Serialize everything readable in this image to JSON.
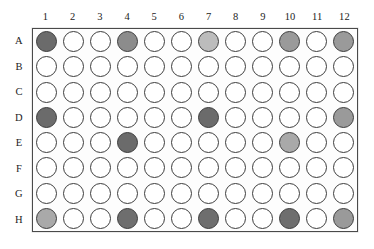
{
  "figure": {
    "plate_format": "96-well",
    "rows": 8,
    "columns": 12
  },
  "column_labels": [
    "1",
    "2",
    "3",
    "4",
    "5",
    "6",
    "7",
    "8",
    "9",
    "10",
    "11",
    "12"
  ],
  "row_labels": [
    "A",
    "B",
    "C",
    "D",
    "E",
    "F",
    "G",
    "H"
  ],
  "colors": {
    "empty_well_fill": "#ffffff",
    "well_outline": "#3d3d3d",
    "plate_border": "#4a4a4a",
    "plate_fill": "#fdfdfd",
    "background": "#ffffff",
    "label_text": "#1c1c1c",
    "shade_dark": "#6b6b6b",
    "shade_medium": "#8c8c8c",
    "shade_light": "#a9a9a9",
    "shade_pale": "#bcbcbc"
  },
  "chart_data": {
    "type": "heatmap",
    "xlabel": "",
    "ylabel": "",
    "grid": true,
    "legend_position": "none",
    "categories": [
      "1",
      "2",
      "3",
      "4",
      "5",
      "6",
      "7",
      "8",
      "9",
      "10",
      "11",
      "12"
    ],
    "row_categories": [
      "A",
      "B",
      "C",
      "D",
      "E",
      "F",
      "G",
      "H"
    ],
    "note": "values are well fill shades; 0 = empty (white), higher = darker fill",
    "filled_wells": [
      {
        "well": "A1",
        "row": "A",
        "column": 1,
        "shade": "#6b6b6b"
      },
      {
        "well": "A4",
        "row": "A",
        "column": 4,
        "shade": "#8c8c8c"
      },
      {
        "well": "A7",
        "row": "A",
        "column": 7,
        "shade": "#bcbcbc"
      },
      {
        "well": "A10",
        "row": "A",
        "column": 10,
        "shade": "#9a9a9a"
      },
      {
        "well": "A12",
        "row": "A",
        "column": 12,
        "shade": "#9a9a9a"
      },
      {
        "well": "D1",
        "row": "D",
        "column": 1,
        "shade": "#6b6b6b"
      },
      {
        "well": "D7",
        "row": "D",
        "column": 7,
        "shade": "#6b6b6b"
      },
      {
        "well": "D12",
        "row": "D",
        "column": 12,
        "shade": "#9a9a9a"
      },
      {
        "well": "E4",
        "row": "E",
        "column": 4,
        "shade": "#6b6b6b"
      },
      {
        "well": "E10",
        "row": "E",
        "column": 10,
        "shade": "#a9a9a9"
      },
      {
        "well": "H1",
        "row": "H",
        "column": 1,
        "shade": "#a9a9a9"
      },
      {
        "well": "H4",
        "row": "H",
        "column": 4,
        "shade": "#6e6e6e"
      },
      {
        "well": "H7",
        "row": "H",
        "column": 7,
        "shade": "#6e6e6e"
      },
      {
        "well": "H10",
        "row": "H",
        "column": 10,
        "shade": "#6e6e6e"
      },
      {
        "well": "H12",
        "row": "H",
        "column": 12,
        "shade": "#9a9a9a"
      }
    ],
    "series": [
      {
        "name": "A",
        "values": [
          "#6b6b6b",
          0,
          0,
          "#8c8c8c",
          0,
          0,
          "#bcbcbc",
          0,
          0,
          "#9a9a9a",
          0,
          "#9a9a9a"
        ]
      },
      {
        "name": "B",
        "values": [
          0,
          0,
          0,
          0,
          0,
          0,
          0,
          0,
          0,
          0,
          0,
          0
        ]
      },
      {
        "name": "C",
        "values": [
          0,
          0,
          0,
          0,
          0,
          0,
          0,
          0,
          0,
          0,
          0,
          0
        ]
      },
      {
        "name": "D",
        "values": [
          "#6b6b6b",
          0,
          0,
          0,
          0,
          0,
          "#6b6b6b",
          0,
          0,
          0,
          0,
          "#9a9a9a"
        ]
      },
      {
        "name": "E",
        "values": [
          0,
          0,
          0,
          "#6b6b6b",
          0,
          0,
          0,
          0,
          0,
          "#a9a9a9",
          0,
          0
        ]
      },
      {
        "name": "F",
        "values": [
          0,
          0,
          0,
          0,
          0,
          0,
          0,
          0,
          0,
          0,
          0,
          0
        ]
      },
      {
        "name": "G",
        "values": [
          0,
          0,
          0,
          0,
          0,
          0,
          0,
          0,
          0,
          0,
          0,
          0
        ]
      },
      {
        "name": "H",
        "values": [
          "#a9a9a9",
          0,
          0,
          "#6e6e6e",
          0,
          0,
          "#6e6e6e",
          0,
          0,
          "#6e6e6e",
          0,
          "#9a9a9a"
        ]
      }
    ]
  }
}
